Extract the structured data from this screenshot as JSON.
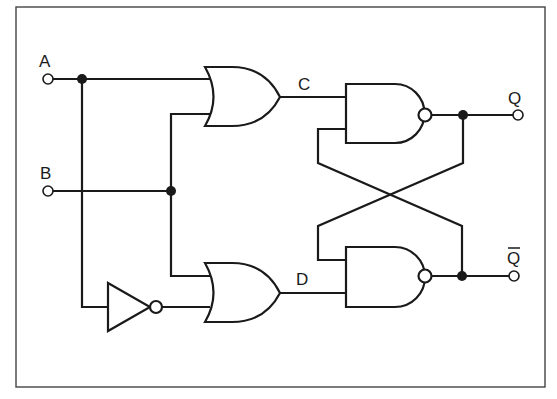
{
  "diagram": {
    "type": "logic-circuit",
    "inputs": [
      {
        "id": "A",
        "label": "A"
      },
      {
        "id": "B",
        "label": "B"
      }
    ],
    "outputs": [
      {
        "id": "Q",
        "label": "Q"
      },
      {
        "id": "Qbar",
        "label": "Q̄"
      }
    ],
    "nodes": [
      {
        "id": "C",
        "label": "C"
      },
      {
        "id": "D",
        "label": "D"
      }
    ],
    "gates": [
      {
        "id": "or-top",
        "type": "OR",
        "inputs": [
          "A",
          "B"
        ],
        "output": "C"
      },
      {
        "id": "not",
        "type": "NOT",
        "inputs": [
          "A"
        ],
        "output": "notA"
      },
      {
        "id": "or-bottom",
        "type": "OR",
        "inputs": [
          "B",
          "notA"
        ],
        "output": "D"
      },
      {
        "id": "nand-top",
        "type": "NAND",
        "inputs": [
          "C",
          "Qbar"
        ],
        "output": "Q"
      },
      {
        "id": "nand-bottom",
        "type": "NAND",
        "inputs": [
          "Q",
          "D"
        ],
        "output": "Qbar"
      }
    ],
    "colors": {
      "ink": "#1a1a1a",
      "background": "#ffffff"
    }
  }
}
